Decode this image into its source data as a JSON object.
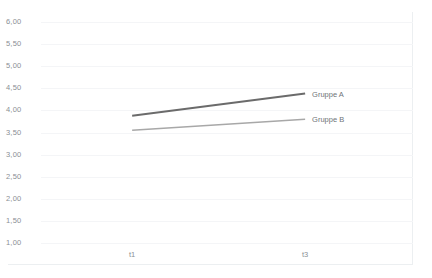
{
  "chart_data": {
    "type": "line",
    "title": "",
    "xlabel": "",
    "ylabel": "",
    "categories": [
      "t1",
      "t3"
    ],
    "x": [
      0,
      1
    ],
    "ylim": [
      1.0,
      6.0
    ],
    "ytick_step": 0.5,
    "ytick_labels": [
      "6,00",
      "5,50",
      "5,00",
      "4,50",
      "4,00",
      "3,50",
      "3,00",
      "2,50",
      "2,00",
      "1,50",
      "1,00"
    ],
    "ytick_values": [
      6.0,
      5.5,
      5.0,
      4.5,
      4.0,
      3.5,
      3.0,
      2.5,
      2.0,
      1.5,
      1.0
    ],
    "grid": true,
    "legend_position": "inline-right",
    "decimal_separator": ",",
    "series": [
      {
        "name": "Gruppe A",
        "values": [
          3.88,
          4.38
        ],
        "color": "#6b6b6b",
        "width": 2.0
      },
      {
        "name": "Gruppe B",
        "values": [
          3.55,
          3.8
        ],
        "color": "#a8a8a8",
        "width": 1.4
      }
    ]
  },
  "style": {
    "background": "#ffffff",
    "gridline_color": "#f4f5f7",
    "axis_text_color": "#8a8f94",
    "legend_text_color": "#6f7478",
    "frame_border_color": "#eceff1"
  }
}
